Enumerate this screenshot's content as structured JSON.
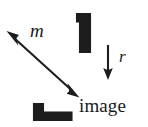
{
  "figure": {
    "name": "reflection-diagram",
    "background_color": "#ffffff",
    "ink_color": "#1a1a1a",
    "width": 148,
    "height": 127,
    "labels": {
      "mirror_line": "m",
      "reflection": "r",
      "image_caption": "image"
    },
    "shapes": {
      "object_lamina": {
        "name": "L-shaped object",
        "orientation": "vertical bar with foot at top-left",
        "bounds": {
          "x": 76,
          "y": 13,
          "width": 15,
          "height": 40
        }
      },
      "image_lamina": {
        "name": "L-shaped image",
        "orientation": "horizontal bar with block at left end",
        "bounds": {
          "x": 33,
          "y": 103,
          "width": 40,
          "height": 18
        }
      }
    },
    "arrows": {
      "mirror_axis": {
        "name": "double-headed mirror line arrow",
        "double_headed": true,
        "from": {
          "x": 7,
          "y": 31
        },
        "to": {
          "x": 79,
          "y": 97
        }
      },
      "reflection_direction": {
        "name": "downward reflection arrow",
        "double_headed": false,
        "from": {
          "x": 108,
          "y": 45
        },
        "to": {
          "x": 108,
          "y": 79
        }
      }
    }
  }
}
